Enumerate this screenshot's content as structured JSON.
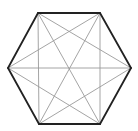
{
  "diagram": {
    "type": "complete-graph-hexagon",
    "vertex_count": 6,
    "vertices": [
      {
        "id": "TL",
        "x": 38,
        "y": 13
      },
      {
        "id": "TR",
        "x": 100,
        "y": 13
      },
      {
        "id": "R",
        "x": 131,
        "y": 68
      },
      {
        "id": "BR",
        "x": 100,
        "y": 124
      },
      {
        "id": "BL",
        "x": 39,
        "y": 124
      },
      {
        "id": "L",
        "x": 8,
        "y": 68
      }
    ],
    "outline_edges": [
      [
        "TL",
        "TR"
      ],
      [
        "TR",
        "R"
      ],
      [
        "R",
        "BR"
      ],
      [
        "BR",
        "BL"
      ],
      [
        "BL",
        "L"
      ],
      [
        "L",
        "TL"
      ]
    ],
    "diagonal_edges": [
      [
        "TL",
        "R"
      ],
      [
        "TL",
        "BR"
      ],
      [
        "TL",
        "BL"
      ],
      [
        "TR",
        "BR"
      ],
      [
        "TR",
        "BL"
      ],
      [
        "TR",
        "L"
      ],
      [
        "R",
        "BL"
      ],
      [
        "R",
        "L"
      ],
      [
        "BR",
        "L"
      ]
    ],
    "colors": {
      "outline": "#222222",
      "diagonal": "#9a9a9a",
      "background": "#ffffff"
    }
  }
}
